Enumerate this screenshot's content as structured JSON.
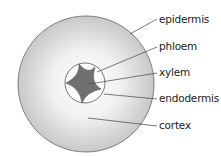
{
  "diagram": {
    "labels": [
      {
        "text": "epidermis"
      },
      {
        "text": "phloem"
      },
      {
        "text": "xylem"
      },
      {
        "text": "endodermis"
      },
      {
        "text": "cortex"
      }
    ],
    "colors": {
      "cortex_edge": "#c9c9c9",
      "xylem": "#707070",
      "outline": "#555555"
    }
  }
}
